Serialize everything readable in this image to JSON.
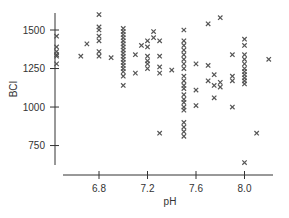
{
  "chart_data": {
    "type": "scatter",
    "title": "",
    "xlabel": "pH",
    "ylabel": "BCI",
    "xticks": [
      6.8,
      7.2,
      7.6,
      8.0
    ],
    "yticks": [
      750,
      1000,
      1250,
      1500
    ],
    "xlim": [
      6.4,
      8.3
    ],
    "ylim": [
      620,
      1640
    ],
    "grid": false,
    "legend": "none",
    "marker": "x",
    "color": "#555555",
    "points": [
      [
        6.45,
        1460
      ],
      [
        6.45,
        1390
      ],
      [
        6.45,
        1360
      ],
      [
        6.45,
        1340
      ],
      [
        6.45,
        1330
      ],
      [
        6.45,
        1280
      ],
      [
        6.65,
        1330
      ],
      [
        6.7,
        1410
      ],
      [
        6.8,
        1600
      ],
      [
        6.8,
        1520
      ],
      [
        6.8,
        1500
      ],
      [
        6.8,
        1460
      ],
      [
        6.8,
        1430
      ],
      [
        6.8,
        1360
      ],
      [
        6.8,
        1330
      ],
      [
        6.9,
        1320
      ],
      [
        7.0,
        1510
      ],
      [
        7.0,
        1490
      ],
      [
        7.0,
        1470
      ],
      [
        7.0,
        1450
      ],
      [
        7.0,
        1430
      ],
      [
        7.0,
        1410
      ],
      [
        7.0,
        1390
      ],
      [
        7.0,
        1370
      ],
      [
        7.0,
        1350
      ],
      [
        7.0,
        1330
      ],
      [
        7.0,
        1310
      ],
      [
        7.0,
        1290
      ],
      [
        7.0,
        1270
      ],
      [
        7.0,
        1250
      ],
      [
        7.0,
        1230
      ],
      [
        7.0,
        1200
      ],
      [
        7.0,
        1140
      ],
      [
        7.1,
        1340
      ],
      [
        7.1,
        1220
      ],
      [
        7.15,
        1400
      ],
      [
        7.2,
        1430
      ],
      [
        7.2,
        1390
      ],
      [
        7.2,
        1330
      ],
      [
        7.2,
        1300
      ],
      [
        7.2,
        1280
      ],
      [
        7.2,
        1250
      ],
      [
        7.25,
        1490
      ],
      [
        7.25,
        1450
      ],
      [
        7.3,
        1430
      ],
      [
        7.3,
        1330
      ],
      [
        7.3,
        1260
      ],
      [
        7.3,
        1220
      ],
      [
        7.3,
        830
      ],
      [
        7.4,
        1240
      ],
      [
        7.5,
        1500
      ],
      [
        7.5,
        1430
      ],
      [
        7.5,
        1400
      ],
      [
        7.5,
        1370
      ],
      [
        7.5,
        1340
      ],
      [
        7.5,
        1310
      ],
      [
        7.5,
        1280
      ],
      [
        7.5,
        1250
      ],
      [
        7.5,
        1200
      ],
      [
        7.5,
        1170
      ],
      [
        7.5,
        1140
      ],
      [
        7.5,
        1120
      ],
      [
        7.5,
        1080
      ],
      [
        7.5,
        1050
      ],
      [
        7.5,
        1030
      ],
      [
        7.5,
        1000
      ],
      [
        7.5,
        980
      ],
      [
        7.5,
        900
      ],
      [
        7.5,
        870
      ],
      [
        7.5,
        840
      ],
      [
        7.5,
        810
      ],
      [
        7.6,
        1280
      ],
      [
        7.6,
        1110
      ],
      [
        7.6,
        1010
      ],
      [
        7.7,
        1270
      ],
      [
        7.7,
        1170
      ],
      [
        7.7,
        1540
      ],
      [
        7.75,
        1210
      ],
      [
        7.75,
        1060
      ],
      [
        7.75,
        1140
      ],
      [
        7.8,
        1580
      ],
      [
        7.8,
        1160
      ],
      [
        7.8,
        1130
      ],
      [
        7.9,
        1340
      ],
      [
        7.9,
        1200
      ],
      [
        7.9,
        1170
      ],
      [
        7.9,
        1000
      ],
      [
        8.0,
        1440
      ],
      [
        8.0,
        1400
      ],
      [
        8.0,
        1340
      ],
      [
        8.0,
        1310
      ],
      [
        8.0,
        1280
      ],
      [
        8.0,
        1250
      ],
      [
        8.0,
        1230
      ],
      [
        8.0,
        1210
      ],
      [
        8.0,
        1190
      ],
      [
        8.0,
        1170
      ],
      [
        8.0,
        1150
      ],
      [
        8.0,
        640
      ],
      [
        8.1,
        830
      ],
      [
        8.2,
        1310
      ]
    ]
  }
}
